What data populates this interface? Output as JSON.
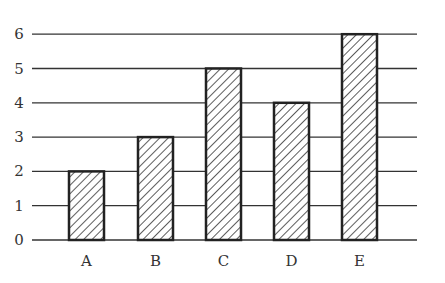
{
  "chart_data": {
    "type": "bar",
    "title": "",
    "xlabel": "",
    "ylabel": "",
    "categories": [
      "A",
      "B",
      "C",
      "D",
      "E"
    ],
    "values": [
      2,
      3,
      5,
      4,
      6
    ],
    "ylim": [
      0,
      6
    ],
    "yticks": [
      0,
      1,
      2,
      3,
      4,
      5,
      6
    ],
    "grid": true,
    "legend": null,
    "bar_fill": "diagonal-hatch",
    "colors": {
      "bar_stroke": "#222222",
      "hatch": "#333333",
      "grid": "#333333",
      "background": "#ffffff"
    }
  }
}
